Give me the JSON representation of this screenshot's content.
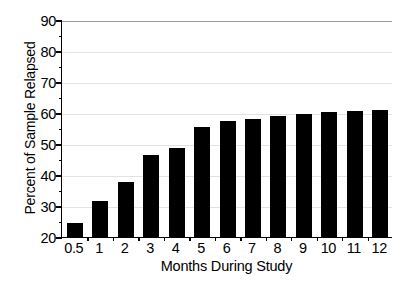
{
  "chart_data": {
    "type": "bar",
    "title": "",
    "xlabel": "Months During Study",
    "ylabel": "Percent of Sample Relapsed",
    "categories": [
      "0.5",
      "1",
      "2",
      "3",
      "4",
      "5",
      "6",
      "7",
      "8",
      "9",
      "10",
      "11",
      "12"
    ],
    "values": [
      24.4,
      31.6,
      37.6,
      46.6,
      48.6,
      55.4,
      57.4,
      58.1,
      59.1,
      59.7,
      60.2,
      60.6,
      61.0
    ],
    "ylim": [
      20,
      90
    ],
    "ytick_labels": [
      "90",
      "80",
      "70",
      "60",
      "50",
      "40",
      "30",
      "20"
    ],
    "ytick_values": [
      90,
      80,
      70,
      60,
      50,
      40,
      30,
      20
    ],
    "ytick_step": 10,
    "yminor_step": 5,
    "grid": "horizontal",
    "legend": "none",
    "bar_color": "#000000",
    "gridline_color": "#e3e3e3",
    "axis_color": "#000000",
    "background_color": "#ffffff"
  }
}
